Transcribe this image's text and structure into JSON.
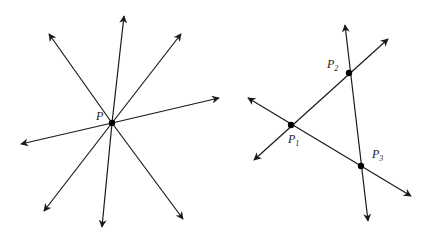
{
  "figure_left": {
    "title": "Concurrent lines through a point",
    "point": {
      "label": "P",
      "x": 112,
      "y": 123,
      "label_x": 96,
      "label_y": 120
    },
    "rays": [
      {
        "name": "ray-top",
        "x": 124,
        "y": 16
      },
      {
        "name": "ray-bottom",
        "x": 102,
        "y": 227
      },
      {
        "name": "ray-upper-left",
        "x": 49,
        "y": 34
      },
      {
        "name": "ray-lower-right",
        "x": 183,
        "y": 219
      },
      {
        "name": "ray-upper-right",
        "x": 181,
        "y": 34
      },
      {
        "name": "ray-lower-left",
        "x": 44,
        "y": 211
      },
      {
        "name": "ray-right",
        "x": 219,
        "y": 98
      },
      {
        "name": "ray-left",
        "x": 21,
        "y": 144
      }
    ]
  },
  "figure_right": {
    "title": "Three lines forming a triangle",
    "points": [
      {
        "label": "P",
        "subscript": "1",
        "x": 291,
        "y": 125,
        "label_x": 288,
        "label_y": 143
      },
      {
        "label": "P",
        "subscript": "2",
        "x": 349,
        "y": 73,
        "label_x": 327,
        "label_y": 68
      },
      {
        "label": "P",
        "subscript": "3",
        "x": 361,
        "y": 166,
        "label_x": 372,
        "label_y": 158
      }
    ],
    "lines": [
      {
        "name": "line-p1-p3",
        "x1": 248,
        "y1": 98,
        "x2": 411,
        "y2": 196
      },
      {
        "name": "line-p1-p2",
        "x1": 254,
        "y1": 160,
        "x2": 388,
        "y2": 39
      },
      {
        "name": "line-p2-p3",
        "x1": 345,
        "y1": 25,
        "x2": 368,
        "y2": 221
      }
    ]
  },
  "colors": {
    "stroke": "#1a1a1a",
    "point": "#000000",
    "background": "#ffffff"
  }
}
